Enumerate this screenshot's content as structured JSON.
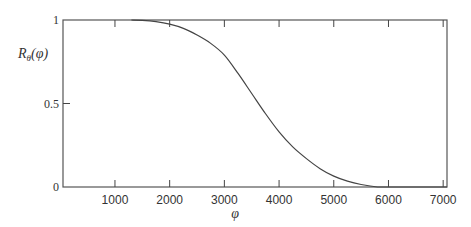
{
  "chart_data": {
    "type": "line",
    "title": "",
    "xlabel": "φ",
    "ylabel": "R_θ(φ)",
    "ylabel_main": "R",
    "ylabel_sub": "θ",
    "ylabel_arg": "(φ)",
    "xlim": [
      50,
      7070
    ],
    "ylim": [
      0,
      1
    ],
    "grid": false,
    "legend": null,
    "x_ticks": [
      1000,
      2000,
      3000,
      4000,
      5000,
      6000,
      7000
    ],
    "x_tick_labels": [
      "1000",
      "2000",
      "3000",
      "4000",
      "5000",
      "6000",
      "7000"
    ],
    "y_ticks": [
      0,
      0.5,
      1
    ],
    "y_tick_labels": [
      "0",
      "0.5",
      "1"
    ],
    "series": [
      {
        "name": "R_θ(φ)",
        "color": "#444444",
        "x": [
          1300,
          1500,
          1750,
          2000,
          2250,
          2500,
          2750,
          3000,
          3250,
          3500,
          3750,
          4000,
          4250,
          4500,
          4750,
          5000,
          5250,
          5500,
          5800,
          6000,
          6500,
          7070
        ],
        "y": [
          1.0,
          0.998,
          0.99,
          0.975,
          0.95,
          0.91,
          0.86,
          0.79,
          0.68,
          0.56,
          0.44,
          0.33,
          0.24,
          0.17,
          0.11,
          0.065,
          0.035,
          0.015,
          0.0,
          0.0,
          0.0,
          0.0
        ]
      }
    ]
  }
}
